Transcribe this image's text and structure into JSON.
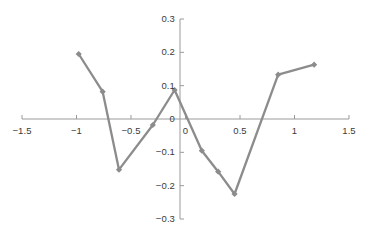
{
  "chart_data": {
    "type": "line",
    "title": "",
    "xlabel": "",
    "ylabel": "",
    "xlim": [
      -1.5,
      1.5
    ],
    "ylim": [
      -0.3,
      0.3
    ],
    "grid": false,
    "legend": "none",
    "x_ticks": [
      -1.5,
      -1,
      -0.5,
      0,
      0.5,
      1,
      1.5
    ],
    "x_tick_labels": [
      "-1.5",
      "-1",
      "-0.5",
      "0",
      "0.5",
      "1",
      "1.5"
    ],
    "y_ticks": [
      0.3,
      0.2,
      0.1,
      0,
      -0.1,
      -0.2,
      -0.3
    ],
    "y_tick_labels": [
      "0.3",
      "0.2",
      "0.1",
      "0",
      "-0.1",
      "-0.2",
      "-0.3"
    ],
    "series": [
      {
        "name": "series-1",
        "color": "#8c8c8c",
        "marker": "diamond",
        "x": [
          -0.98,
          -0.76,
          -0.61,
          -0.3,
          -0.1,
          0.15,
          0.3,
          0.45,
          0.85,
          1.18
        ],
        "y": [
          0.195,
          0.082,
          -0.152,
          -0.018,
          0.087,
          -0.095,
          -0.158,
          -0.225,
          0.133,
          0.163
        ]
      }
    ],
    "axis_color": "#9a9a9a",
    "tick_label_color": "#3b3b3b",
    "background": "#ffffff"
  },
  "geometry": {
    "width": 371,
    "height": 234,
    "x_axis_y_px": 119,
    "y_axis_x_px": 180,
    "x_min_px": 22,
    "x_max_px": 349,
    "y_top_px": 19,
    "y_bottom_px": 219
  }
}
